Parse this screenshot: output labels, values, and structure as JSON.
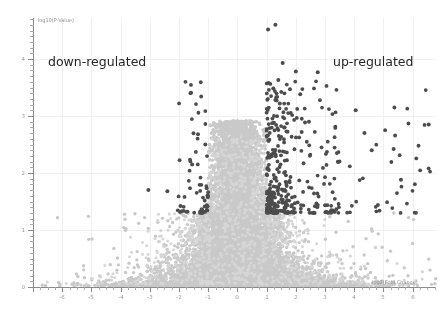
{
  "chart_data": {
    "type": "scatter",
    "title": "",
    "subtitle": "",
    "xlabel": "log2(Fold Change)",
    "ylabel": "-log10(P-Value)",
    "xlim": [
      -7.0,
      6.8
    ],
    "ylim": [
      0,
      4.72
    ],
    "grid": true,
    "legend": null,
    "annotations": [
      {
        "text": "down-regulated",
        "x": -5.2,
        "y": 4.0,
        "color": "#262626"
      },
      {
        "text": "up-regulated",
        "x": 3.6,
        "y": 4.0,
        "color": "#262626"
      }
    ],
    "thresholds": {
      "pvalue_y": 1.3,
      "fold_change_x": [
        -1,
        1
      ]
    },
    "xticks": [
      -6,
      -5,
      -4,
      -3,
      -2,
      -1,
      0,
      1,
      2,
      3,
      4,
      5,
      6
    ],
    "xticklabels": [
      "-6",
      "-5",
      "-4",
      "-3",
      "-2",
      "-1",
      "0",
      "1",
      "2",
      "3",
      "4",
      "5",
      "6"
    ],
    "yticks": [
      0,
      1,
      2,
      3,
      4
    ],
    "yticklabels": [
      "0",
      "1",
      "2",
      "3",
      "4"
    ],
    "series": [
      {
        "name": "not-significant",
        "color": "#c9c9c9",
        "marker_size": 1.7,
        "point_count": 9000
      },
      {
        "name": "significant",
        "color": "#4c4c4c",
        "marker_size": 1.9,
        "point_count": 430
      }
    ],
    "highlighted_points": [
      {
        "x": 1.3,
        "y": 4.6,
        "group": "significant"
      },
      {
        "x": 1.05,
        "y": 4.52,
        "group": "significant"
      },
      {
        "x": 1.55,
        "y": 3.93,
        "group": "significant"
      },
      {
        "x": 2.0,
        "y": 3.78,
        "group": "significant"
      },
      {
        "x": 2.75,
        "y": 3.77,
        "group": "significant"
      },
      {
        "x": 1.4,
        "y": 3.63,
        "group": "significant"
      },
      {
        "x": 1.8,
        "y": 3.47,
        "group": "significant"
      },
      {
        "x": 2.15,
        "y": 3.38,
        "group": "significant"
      },
      {
        "x": 1.3,
        "y": 3.28,
        "group": "significant"
      },
      {
        "x": 1.45,
        "y": 3.22,
        "group": "significant"
      },
      {
        "x": 4.05,
        "y": 3.1,
        "group": "significant"
      },
      {
        "x": 6.55,
        "y": 2.85,
        "group": "significant"
      },
      {
        "x": 1.25,
        "y": 2.88,
        "group": "significant"
      },
      {
        "x": 1.6,
        "y": 2.8,
        "group": "significant"
      },
      {
        "x": 2.45,
        "y": 2.9,
        "group": "significant"
      },
      {
        "x": 2.2,
        "y": 2.72,
        "group": "significant"
      },
      {
        "x": 4.35,
        "y": 2.7,
        "group": "significant"
      },
      {
        "x": 5.4,
        "y": 2.66,
        "group": "significant"
      },
      {
        "x": -1.35,
        "y": 2.68,
        "group": "significant"
      },
      {
        "x": -1.1,
        "y": 2.5,
        "group": "significant"
      },
      {
        "x": -1.55,
        "y": 2.15,
        "group": "significant"
      },
      {
        "x": -3.05,
        "y": 1.7,
        "group": "significant"
      },
      {
        "x": -2.4,
        "y": 1.68,
        "group": "significant"
      },
      {
        "x": -1.95,
        "y": 1.42,
        "group": "significant"
      },
      {
        "x": 5.6,
        "y": 1.88,
        "group": "significant"
      },
      {
        "x": 5.35,
        "y": 2.42,
        "group": "significant"
      },
      {
        "x": 4.6,
        "y": 2.4,
        "group": "significant"
      }
    ]
  },
  "axis": {
    "y_title": "-log10(P-Value)",
    "x_title": "log2(Fold Change)"
  },
  "labels": {
    "down_regulated": "down-regulated",
    "up_regulated": "up-regulated"
  },
  "colors": {
    "background": "#ffffff",
    "axis": "#8a8a8a",
    "grid": "#f0f0f0",
    "tick_text": "#9a9a9a",
    "axis_title": "#8d8d8d",
    "annotation_text": "#262626",
    "point_nonsignificant": "#c9c9c9",
    "point_significant": "#4c4c4c"
  }
}
